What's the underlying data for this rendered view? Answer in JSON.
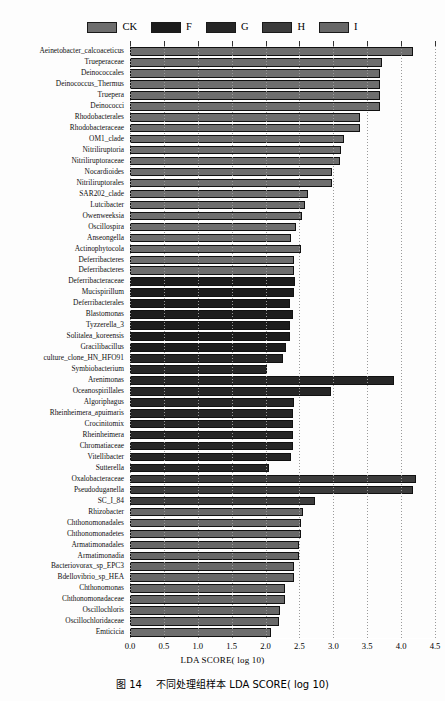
{
  "chart_data": {
    "type": "bar",
    "orientation": "horizontal",
    "title": "",
    "xlabel": "LDA SCORE( log 10)",
    "ylabel": "",
    "xlim": [
      0.0,
      4.5
    ],
    "xticks": [
      "0.0",
      "0.5",
      "1.0",
      "1.5",
      "2.0",
      "2.5",
      "3.0",
      "3.5",
      "4.0",
      "4.5"
    ],
    "grid": "vertical-dotted",
    "legend_position": "top-center",
    "legend": [
      "CK",
      "F",
      "G",
      "H",
      "I"
    ],
    "series": [
      {
        "name": "CK",
        "color": "#6e6e6e"
      },
      {
        "name": "F",
        "color": "#1c1c1c"
      },
      {
        "name": "G",
        "color": "#262626"
      },
      {
        "name": "H",
        "color": "#3c3c3c"
      },
      {
        "name": "I",
        "color": "#686868"
      }
    ],
    "categories": [
      "Aeinetobacter_calcoaceticus",
      "Trueperaceae",
      "Deinococcales",
      "Deinococcus_Thermus",
      "Truepera",
      "Deinococci",
      "Rhodobacterales",
      "Rhodobacteraceae",
      "OM1_clade",
      "Nitriliruptoria",
      "Nitriliruptoraceae",
      "Nocardioides",
      "Nitriliruptorales",
      "SAR202_clade",
      "Lutcibacter",
      "Owenweeksia",
      "Oscillospira",
      "Anseongella",
      "Actinophytocola",
      "Deferribacteres",
      "Deferribacteres",
      "Deferribacteraceae",
      "Mucispirillum",
      "Deferribacterales",
      "Blastomonas",
      "Tyzzerella_3",
      "Solitalea_koreensis",
      "Gracilibacillus",
      "culture_clone_HN_HFO91",
      "Symbiobacterium",
      "Arenimonas",
      "Oceanospirillales",
      "Algoriphagus",
      "Rheinheimera_apuimaris",
      "Crocinitomix",
      "Rheinheimera",
      "Chromatiaceae",
      "Vitellibacter",
      "Sutterella",
      "Oxalobacteraceae",
      "Pseudoduganella",
      "SC_I_84",
      "Rhizobacter",
      "Chthonomonadales",
      "Chthonomonadetes",
      "Armatimonadales",
      "Armatimonadia",
      "Bacteriovorax_sp_EPC3",
      "Bdellovibrio_sp_HEA",
      "Chthonomonas",
      "Chthonomonadaceae",
      "Oscillochloris",
      "Oscillochloridaceae",
      "Emticicia"
    ],
    "values": [
      4.17,
      3.72,
      3.69,
      3.69,
      3.69,
      3.69,
      3.4,
      3.4,
      3.15,
      3.12,
      3.1,
      2.98,
      2.98,
      2.62,
      2.58,
      2.54,
      2.45,
      2.38,
      2.52,
      2.42,
      2.42,
      2.43,
      2.42,
      2.36,
      2.4,
      2.36,
      2.36,
      2.3,
      2.25,
      2.02,
      3.9,
      2.97,
      2.42,
      2.4,
      2.4,
      2.4,
      2.4,
      2.38,
      2.05,
      4.22,
      4.17,
      2.73,
      2.55,
      2.52,
      2.52,
      2.5,
      2.5,
      2.42,
      2.42,
      2.28,
      2.28,
      2.22,
      2.2,
      2.08
    ],
    "groups": [
      "CK",
      "CK",
      "CK",
      "CK",
      "CK",
      "CK",
      "CK",
      "CK",
      "CK",
      "CK",
      "CK",
      "CK",
      "CK",
      "CK",
      "CK",
      "CK",
      "CK",
      "CK",
      "CK",
      "CK",
      "CK",
      "F",
      "F",
      "F",
      "F",
      "F",
      "F",
      "F",
      "G",
      "G",
      "G",
      "G",
      "G",
      "G",
      "G",
      "G",
      "G",
      "G",
      "G",
      "H",
      "H",
      "H",
      "I",
      "I",
      "I",
      "I",
      "I",
      "I",
      "I",
      "I",
      "I",
      "I",
      "I"
    ]
  },
  "xaxis": {
    "title": "LDA SCORE( log 10)",
    "ticks": [
      "0.0",
      "0.5",
      "1.0",
      "1.5",
      "2.0",
      "2.5",
      "3.0",
      "3.5",
      "4.0",
      "4.5"
    ]
  },
  "legend": {
    "items": [
      {
        "label": "CK",
        "color": "#6e6e6e"
      },
      {
        "label": "F",
        "color": "#1c1c1c"
      },
      {
        "label": "G",
        "color": "#262626"
      },
      {
        "label": "H",
        "color": "#3c3c3c"
      },
      {
        "label": "I",
        "color": "#686868"
      }
    ]
  },
  "caption": {
    "figure_number": "图 14",
    "text": "不同处理组样本 LDA SCORE( log 10)",
    "full": "图 14   不同处理组样本 LDA SCORE( log 10)"
  }
}
